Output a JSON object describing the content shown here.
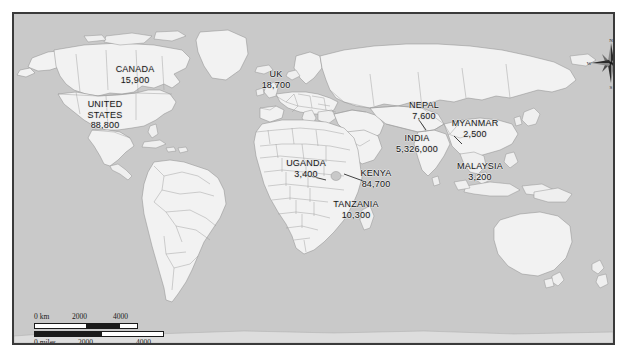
{
  "map": {
    "type": "world-choropleth-annotated",
    "colors": {
      "ocean": "#c9c9c9",
      "land": "#f2f2f2",
      "border_line": "#9a9a9a",
      "coastline": "#8d8d8d",
      "frame": "#3a3a3a",
      "label_text": "#161616",
      "page_background": "#ffffff"
    },
    "labels": [
      {
        "name": "CANADA",
        "value": "15,900"
      },
      {
        "name": "UNITED\nSTATES",
        "value": "88,800"
      },
      {
        "name": "UK",
        "value": "18,700"
      },
      {
        "name": "NEPAL",
        "value": "7,600"
      },
      {
        "name": "MYANMAR",
        "value": "2,500"
      },
      {
        "name": "INDIA",
        "value": "5,326,000"
      },
      {
        "name": "MALAYSIA",
        "value": "3,200"
      },
      {
        "name": "UGANDA",
        "value": "3,400"
      },
      {
        "name": "KENYA",
        "value": "84,700"
      },
      {
        "name": "TANZANIA",
        "value": "10,300"
      }
    ],
    "compass": {
      "north": "N",
      "south": "S",
      "east": "E",
      "west": "W"
    },
    "scale": {
      "km": {
        "unit": "0 km",
        "ticks": [
          "0 km",
          "2000",
          "4000"
        ]
      },
      "miles": {
        "unit": "0 miles",
        "ticks": [
          "0 miles",
          "2000",
          "4000"
        ]
      }
    }
  },
  "chart_data": {
    "type": "map",
    "title": "",
    "categories": [
      "CANADA",
      "UNITED STATES",
      "UK",
      "NEPAL",
      "MYANMAR",
      "INDIA",
      "MALAYSIA",
      "UGANDA",
      "KENYA",
      "TANZANIA"
    ],
    "values": [
      15900,
      88800,
      18700,
      7600,
      2500,
      5326000,
      3200,
      3400,
      84700,
      10300
    ],
    "value_labels": [
      "15,900",
      "88,800",
      "18,700",
      "7,600",
      "2,500",
      "5,326,000",
      "3,200",
      "3,400",
      "84,700",
      "10,300"
    ],
    "xlabel": "",
    "ylabel": "",
    "legend": [],
    "grid": false
  }
}
